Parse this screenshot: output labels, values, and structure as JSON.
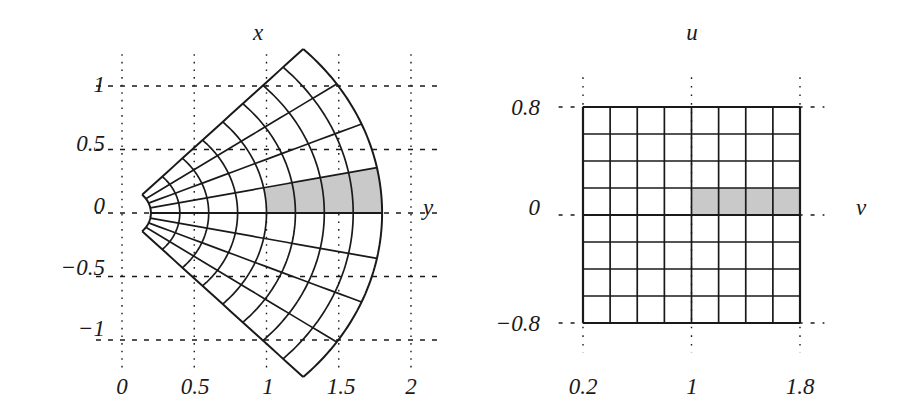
{
  "figure": {
    "background": "#ffffff",
    "ink": "#1a1a1a",
    "shade_color": "#c9c9c9"
  },
  "chart_data": [
    {
      "type": "line",
      "panel": "left",
      "title": "",
      "xlabel": "y",
      "ylabel": "x",
      "xlim": [
        -0.2,
        2.25
      ],
      "ylim": [
        -1.25,
        1.25
      ],
      "grid": true,
      "grid_style": "dotted",
      "xticks": [
        0,
        0.5,
        1,
        1.5,
        2
      ],
      "xticklabels": [
        "0",
        "0.5",
        "1",
        "1.5",
        "2"
      ],
      "yticks": [
        1,
        0.5,
        0,
        -0.5,
        -1
      ],
      "yticklabels": [
        "1",
        "0.5",
        "0",
        "-0.5",
        "-1"
      ],
      "description": "Image of a polar rectangle under the map (r,theta) -> (r cos theta, r sin theta), drawn as a curvilinear 8x8 mesh",
      "mesh": {
        "r_min": 0.2,
        "r_max": 1.8,
        "r_steps": 8,
        "theta_min": -0.8,
        "theta_max": 0.8,
        "theta_steps": 8
      },
      "highlight": {
        "r_range": [
          1.0,
          1.8
        ],
        "theta_range": [
          0.0,
          0.2
        ],
        "cells": 4
      }
    },
    {
      "type": "heatmap",
      "panel": "right",
      "title": "",
      "xlabel": "v",
      "ylabel": "u",
      "xlim": [
        0.0,
        2.05
      ],
      "ylim": [
        -1.05,
        1.05
      ],
      "grid": true,
      "grid_style": "dotted",
      "xticks": [
        0.2,
        1,
        1.8
      ],
      "xticklabels": [
        "0.2",
        "1",
        "1.8"
      ],
      "yticks": [
        0.8,
        0,
        -0.8
      ],
      "yticklabels": [
        "0.8",
        "0",
        "-0.8"
      ],
      "description": "Domain rectangle 0.2<=v<=1.8, -0.8<=u<=0.8 divided into an 8x8 uniform mesh",
      "mesh": {
        "v_min": 0.2,
        "v_max": 1.8,
        "v_steps": 8,
        "u_min": -0.8,
        "u_max": 0.8,
        "u_steps": 8
      },
      "highlight": {
        "v_range": [
          1.0,
          1.8
        ],
        "u_range": [
          0.0,
          0.2
        ],
        "cells": 4
      }
    }
  ],
  "left_panel": {
    "axis_title_top": "x",
    "axis_title_right": "y",
    "y_tick_labels": [
      "1",
      "0.5",
      "0",
      "−0.5",
      "−1"
    ],
    "x_tick_labels": [
      "0",
      "0.5",
      "1",
      "1.5",
      "2"
    ]
  },
  "right_panel": {
    "axis_title_top": "u",
    "axis_title_right": "v",
    "y_tick_labels": [
      "0.8",
      "0",
      "−0.8"
    ],
    "x_tick_labels": [
      "0.2",
      "1",
      "1.8"
    ]
  }
}
